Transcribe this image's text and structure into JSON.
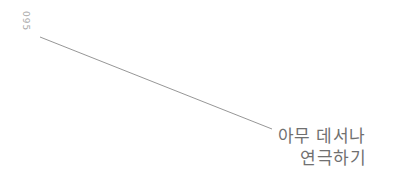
{
  "page": {
    "number": "095"
  },
  "title": {
    "lines": [
      "아무 데서나",
      "연극하기"
    ]
  },
  "decoration": {
    "line": {
      "x1": 40,
      "y1": 37,
      "x2": 272,
      "y2": 129,
      "color": "#8a8a8a"
    }
  },
  "colors": {
    "background": "#ffffff",
    "page_number": "#a8a8a8",
    "title_text": "#707070",
    "line": "#8a8a8a"
  }
}
